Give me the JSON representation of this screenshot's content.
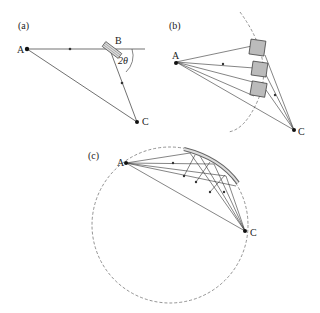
{
  "panels": {
    "a": {
      "label": "(a)",
      "point_A": "A",
      "point_B": "B",
      "point_C": "C",
      "angle": "2θ"
    },
    "b": {
      "label": "(b)",
      "point_A": "A",
      "point_C": "C"
    },
    "c": {
      "label": "(c)",
      "point_A": "A",
      "point_C": "C"
    }
  },
  "colors": {
    "line": "#333333",
    "crystal": "#777777",
    "dashed": "#666666"
  }
}
